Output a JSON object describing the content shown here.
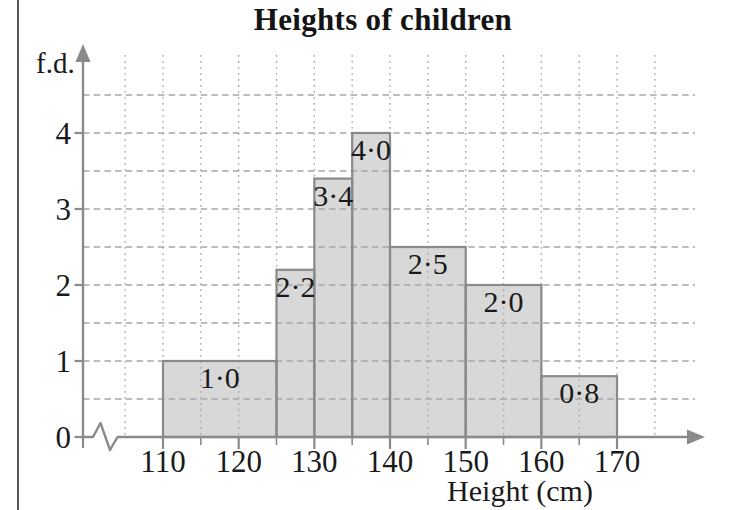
{
  "chart_data": {
    "type": "bar",
    "subtype": "histogram",
    "title": "Heights of children",
    "xlabel": "Height (cm)",
    "ylabel": "f.d.",
    "bins": [
      {
        "x0": 110,
        "x1": 125,
        "fd": 1.0,
        "label": "1·0"
      },
      {
        "x0": 125,
        "x1": 130,
        "fd": 2.2,
        "label": "2·2"
      },
      {
        "x0": 130,
        "x1": 135,
        "fd": 3.4,
        "label": "3·4"
      },
      {
        "x0": 135,
        "x1": 140,
        "fd": 4.0,
        "label": "4·0"
      },
      {
        "x0": 140,
        "x1": 150,
        "fd": 2.5,
        "label": "2·5"
      },
      {
        "x0": 150,
        "x1": 160,
        "fd": 2.0,
        "label": "2·0"
      },
      {
        "x0": 160,
        "x1": 170,
        "fd": 0.8,
        "label": "0·8"
      }
    ],
    "x_ticks_major": [
      110,
      120,
      130,
      140,
      150,
      160,
      170
    ],
    "x_tick_labels": [
      "110",
      "120",
      "130",
      "140",
      "150",
      "160",
      "170"
    ],
    "x_ticks_minor": [
      115,
      125,
      135,
      145,
      155,
      165
    ],
    "y_ticks": [
      0,
      1,
      2,
      3,
      4
    ],
    "y_tick_labels": [
      "0",
      "1",
      "2",
      "3",
      "4"
    ],
    "xlim": [
      100,
      178
    ],
    "ylim": [
      0,
      5
    ],
    "x_grid": {
      "start": 105,
      "end": 175,
      "step": 5,
      "style": "dotted"
    },
    "y_grid": {
      "start": 0.5,
      "end": 4.5,
      "step": 0.5,
      "style": "dashed"
    },
    "axis_break_x": true,
    "legend": false,
    "grid": true,
    "colors": {
      "bar_fill": "#d8d8d8",
      "bar_border": "#8a8a8a",
      "axis": "#8a8a8a",
      "grid": "#a6a6a6",
      "text": "#1a1a1a"
    }
  }
}
